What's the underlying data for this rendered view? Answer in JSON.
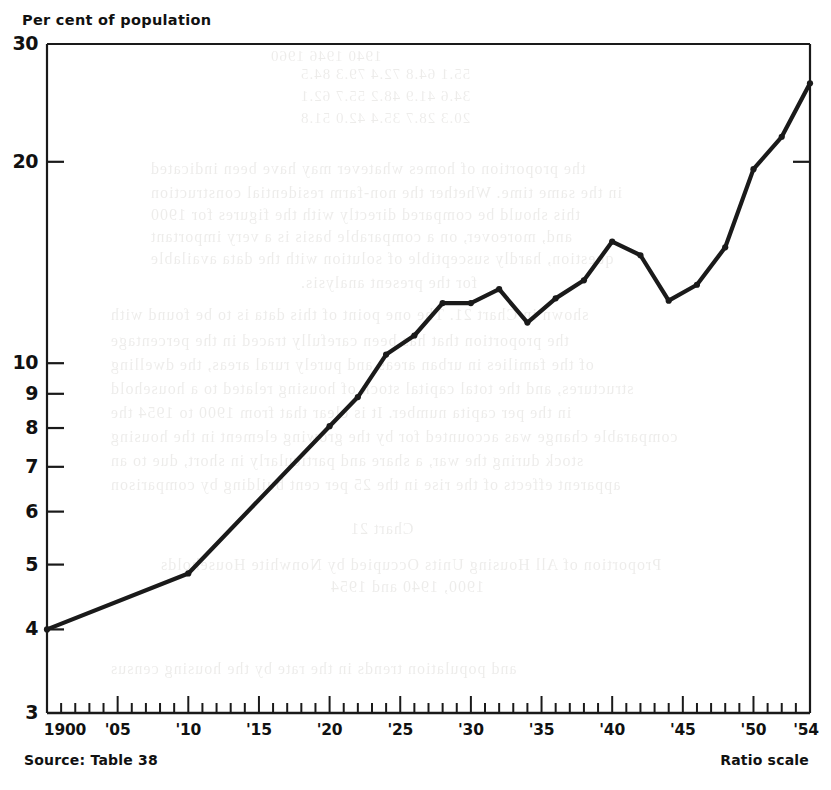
{
  "figure": {
    "axis_title": "Per cent of population",
    "source_note": "Source: Table 38",
    "scale_note": "Ratio scale",
    "line_color": "#1a1a1a",
    "axis_color": "#1a1a1a",
    "background": "#ffffff"
  },
  "yaxis": {
    "labels": [
      "30",
      "20",
      "10",
      "9",
      "8",
      "7",
      "6",
      "5",
      "4",
      "3"
    ],
    "values": [
      30,
      20,
      10,
      9,
      8,
      7,
      6,
      5,
      4,
      3
    ]
  },
  "xaxis": {
    "labels": [
      "1900",
      "'05",
      "'10",
      "'15",
      "'20",
      "'25",
      "'30",
      "'35",
      "'40",
      "'45",
      "'50",
      "'54"
    ],
    "values": [
      1900,
      1905,
      1910,
      1915,
      1920,
      1925,
      1930,
      1935,
      1940,
      1945,
      1950,
      1954
    ]
  },
  "ghost_text": [
    {
      "x": 270,
      "y": 48,
      "size": 15,
      "text": "1940          1946          1960"
    },
    {
      "x": 300,
      "y": 66,
      "size": 15,
      "text": "55.1      64.8      72.4      79.3      84.5"
    },
    {
      "x": 300,
      "y": 88,
      "size": 15,
      "text": "34.6      41.9      48.2      55.7      62.1"
    },
    {
      "x": 300,
      "y": 110,
      "size": 15,
      "text": "20.3      28.7      35.4      42.0      51.8"
    },
    {
      "x": 150,
      "y": 160,
      "size": 16,
      "text": "the proportion of homes  whatever may have been indicated"
    },
    {
      "x": 150,
      "y": 184,
      "size": 16,
      "text": "in the same time. Whether the non-farm residential construction"
    },
    {
      "x": 150,
      "y": 206,
      "size": 16,
      "text": "this should be compared directly with the figures for 1900"
    },
    {
      "x": 150,
      "y": 228,
      "size": 16,
      "text": "and, moreover, on a comparable basis is a very important"
    },
    {
      "x": 150,
      "y": 250,
      "size": 16,
      "text": "question, hardly susceptible of solution with the data available"
    },
    {
      "x": 300,
      "y": 274,
      "size": 16,
      "text": "for the present analysis."
    },
    {
      "x": 110,
      "y": 306,
      "size": 16,
      "text": "shown in Chart 21.   The one point of this data is to be found with"
    },
    {
      "x": 110,
      "y": 332,
      "size": 16,
      "text": "the proportion that has been carefully traced in the percentage"
    },
    {
      "x": 110,
      "y": 356,
      "size": 16,
      "text": "of the families in urban areas and purely rural areas, the dwelling"
    },
    {
      "x": 110,
      "y": 380,
      "size": 16,
      "text": "structures, and the total capital stock of housing related to a household"
    },
    {
      "x": 110,
      "y": 404,
      "size": 16,
      "text": "in the per capita number. It is clear that from 1900 to 1954 the"
    },
    {
      "x": 110,
      "y": 428,
      "size": 16,
      "text": "comparable change was accounted for by the growing element in the housing"
    },
    {
      "x": 110,
      "y": 452,
      "size": 16,
      "text": "stock during the war, a share and particularly in short, due to an"
    },
    {
      "x": 110,
      "y": 476,
      "size": 16,
      "text": "apparent effects of the rise in the 25 per cent building by comparison"
    },
    {
      "x": 350,
      "y": 520,
      "size": 16,
      "text": "Chart 21"
    },
    {
      "x": 160,
      "y": 556,
      "size": 16,
      "text": "Proportion of All Housing Units Occupied by Nonwhite Households"
    },
    {
      "x": 330,
      "y": 578,
      "size": 16,
      "text": "1900, 1940 and 1954"
    },
    {
      "x": 110,
      "y": 660,
      "size": 16,
      "text": "and population trends in the rate by the housing census"
    }
  ],
  "chart_data": {
    "type": "line",
    "title": "Per cent of population",
    "xlabel": "",
    "ylabel": "Per cent of population",
    "yscale": "log",
    "ylim": [
      3,
      30
    ],
    "xlim": [
      1900,
      1954
    ],
    "grid": false,
    "legend": null,
    "source": "Source: Table 38",
    "note": "Ratio scale",
    "series": [
      {
        "name": "Per cent of population",
        "x": [
          1900,
          1910,
          1920,
          1922,
          1924,
          1926,
          1928,
          1930,
          1932,
          1934,
          1936,
          1938,
          1940,
          1942,
          1944,
          1946,
          1948,
          1950,
          1952,
          1954
        ],
        "values": [
          4.0,
          4.85,
          8.05,
          8.9,
          10.3,
          11.0,
          12.3,
          12.3,
          12.9,
          11.5,
          12.5,
          13.3,
          15.2,
          14.5,
          12.4,
          13.1,
          14.9,
          19.5,
          21.8,
          26.2
        ]
      }
    ]
  }
}
